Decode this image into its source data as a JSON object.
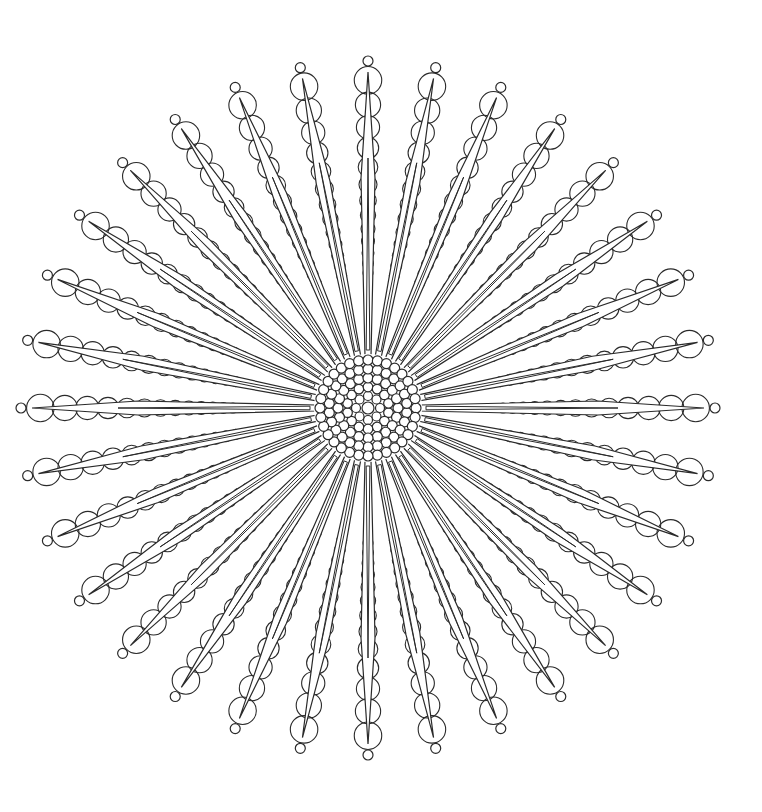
{
  "artwork": {
    "type": "mandala-coloring-page",
    "background": "#ffffff",
    "stroke": "#2a2a2a",
    "center": [
      368,
      408
    ],
    "ray_count": 32,
    "ray_length": 344,
    "tip_circle_radius": 5,
    "core": {
      "center_circle_radius": 6,
      "rings": [
        {
          "radius": 12,
          "count": 8,
          "circle_r": 4.5
        },
        {
          "radius": 21,
          "count": 14,
          "circle_r": 4.8
        },
        {
          "radius": 30,
          "count": 20,
          "circle_r": 5
        },
        {
          "radius": 39,
          "count": 26,
          "circle_r": 5
        },
        {
          "radius": 48,
          "count": 32,
          "circle_r": 5
        }
      ]
    },
    "bead_chain": {
      "start_radius": 130,
      "end_radius": 330,
      "min_circle_r": 5,
      "max_circle_r": 14.5
    }
  }
}
